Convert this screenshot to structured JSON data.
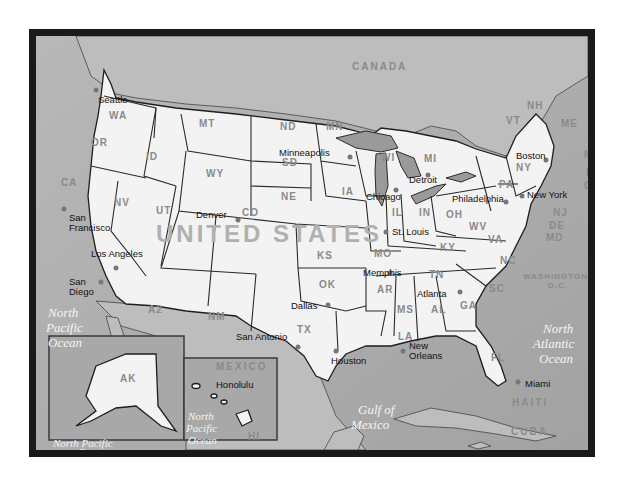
{
  "map": {
    "title": "UNITED STATES",
    "countries": [
      "CANADA",
      "MEXICO",
      "CUBA",
      "HAITI",
      "JAMAICA"
    ],
    "oceans": {
      "north_pacific": [
        "North",
        "Pacific",
        "Ocean"
      ],
      "north_atlantic": [
        "North",
        "Atlantic",
        "Ocean"
      ],
      "gulf": [
        "Gulf of",
        "Mexico"
      ],
      "ak_inset_ocean": [
        "North Pacific",
        "Ocean"
      ],
      "hi_inset_ocean": [
        "North",
        "Pacific",
        "Ocean"
      ]
    },
    "states": {
      "WA": "WA",
      "OR": "OR",
      "CA": "CA",
      "ID": "ID",
      "NV": "NV",
      "MT": "MT",
      "WY": "WY",
      "UT": "UT",
      "CO": "CO",
      "AZ": "A2",
      "NM": "NM",
      "ND": "ND",
      "SD": "SD",
      "NE": "NE",
      "KS": "KS",
      "OK": "OK",
      "TX": "TX",
      "MN": "MN",
      "IA": "IA",
      "MO": "MO",
      "AR": "AR",
      "LA": "LA",
      "WI": "WI",
      "IL": "IL",
      "MI": "MI",
      "IN": "IN",
      "OH": "OH",
      "KY": "KY",
      "TN": "TN",
      "MS": "MS",
      "AL": "AL",
      "GA": "GA",
      "FL": "FL",
      "SC": "SC",
      "NC": "NC",
      "VA": "VA",
      "WV": "WV",
      "PA": "PA",
      "NY": "NY",
      "VT": "VT",
      "NH": "NH",
      "ME": "ME",
      "MA": "MA",
      "RI": "RI",
      "CT": "CT",
      "NJ": "NJ",
      "DE": "DE",
      "MD": "MD",
      "AK": "AK",
      "HI": "HI"
    },
    "dc_label": [
      "WASHINGTON",
      "D.C."
    ],
    "cities": {
      "seattle": "Seattle",
      "san_francisco": [
        "San",
        "Francisco"
      ],
      "los_angeles": "Los Angeles",
      "san_diego": [
        "San",
        "Diego"
      ],
      "denver": "Denver",
      "minneapolis": "Minneapolis",
      "chicago": "Chicago",
      "detroit": "Detroit",
      "st_louis": "St. Louis",
      "memphis": "Memphis",
      "dallas": "Dallas",
      "san_antonio": "San Antonio",
      "houston": "Houston",
      "new_orleans": [
        "New",
        "Orleans"
      ],
      "atlanta": "Atlanta",
      "miami": "Miami",
      "philadelphia": "Philadelphia",
      "new_york": "New York",
      "boston": "Boston",
      "honolulu": "Honolulu"
    }
  }
}
